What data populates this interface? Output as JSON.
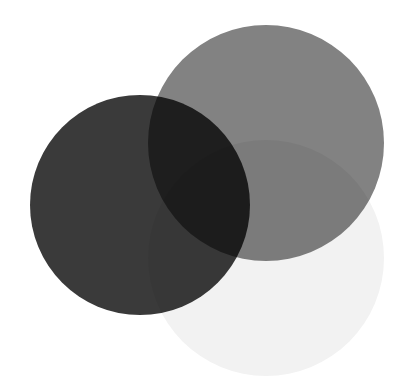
{
  "figure": {
    "background_color": "#ffffff",
    "width": 396,
    "height": 386
  },
  "chart_data": {
    "type": "venn",
    "background": "#ffffff",
    "blend_mode": "multiply",
    "sets": [
      {
        "name": "set-a-dark",
        "label": "A",
        "fill": "#3a3a3a",
        "cx": 140,
        "cy": 205,
        "r": 110
      },
      {
        "name": "set-b-gray",
        "label": "B",
        "fill": "#828282",
        "cx": 266,
        "cy": 143,
        "r": 118
      },
      {
        "name": "set-c-pale",
        "label": "C",
        "fill": "#f2f2f2",
        "cx": 266,
        "cy": 258,
        "r": 118
      }
    ],
    "region_colors": {
      "a_only": "#3a3a3a",
      "b_only": "#828282",
      "c_only": "#f2f2f2",
      "a_and_b": "#101010",
      "b_and_c": "#777777",
      "a_and_c": "#363636",
      "a_and_b_and_c": "#0e0e0e"
    }
  }
}
